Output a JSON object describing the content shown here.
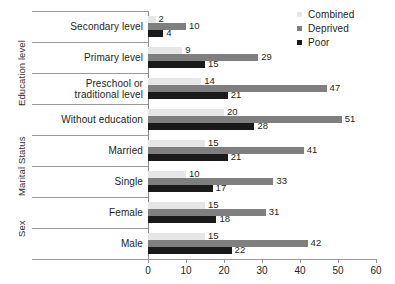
{
  "chart_data": {
    "type": "bar",
    "orientation": "horizontal",
    "title": "",
    "subtitle": "",
    "xlabel": "",
    "ylabel": "",
    "xlim": [
      0,
      60
    ],
    "xticks": [
      0,
      10,
      20,
      30,
      40,
      50,
      60
    ],
    "grid": false,
    "legend_position": "top-right",
    "categories": [
      "Secondary level",
      "Primary level",
      "Preschool or traditional level",
      "Without education",
      "Married",
      "Single",
      "Female",
      "Male"
    ],
    "category_lines": [
      [
        "Secondary level"
      ],
      [
        "Primary level"
      ],
      [
        "Preschool or",
        "traditional level"
      ],
      [
        "Without education"
      ],
      [
        "Married"
      ],
      [
        "Single"
      ],
      [
        "Female"
      ],
      [
        "Male"
      ]
    ],
    "groups": [
      {
        "label": "Education level",
        "categories": [
          "Secondary level",
          "Primary level",
          "Preschool or traditional level",
          "Without education"
        ]
      },
      {
        "label": "Marital Status",
        "categories": [
          "Married",
          "Single"
        ]
      },
      {
        "label": "Sex",
        "categories": [
          "Female",
          "Male"
        ]
      }
    ],
    "series": [
      {
        "name": "Combined",
        "color": "#e6e6e6",
        "values": [
          2,
          9,
          14,
          20,
          15,
          10,
          15,
          15
        ]
      },
      {
        "name": "Deprived",
        "color": "#7f7f7f",
        "values": [
          10,
          29,
          47,
          51,
          41,
          33,
          31,
          42
        ]
      },
      {
        "name": "Poor",
        "color": "#1a1a1a",
        "values": [
          4,
          15,
          21,
          28,
          21,
          17,
          18,
          22
        ]
      }
    ]
  },
  "legend": {
    "items": [
      {
        "label": "Combined",
        "color": "#e6e6e6"
      },
      {
        "label": "Deprived",
        "color": "#7f7f7f"
      },
      {
        "label": "Poor",
        "color": "#1a1a1a"
      }
    ]
  },
  "axis": {
    "x_tick_labels": [
      "0",
      "10",
      "20",
      "30",
      "40",
      "50",
      "60"
    ]
  },
  "group_titles": [
    "Education level",
    "Marital Status",
    "Sex"
  ]
}
